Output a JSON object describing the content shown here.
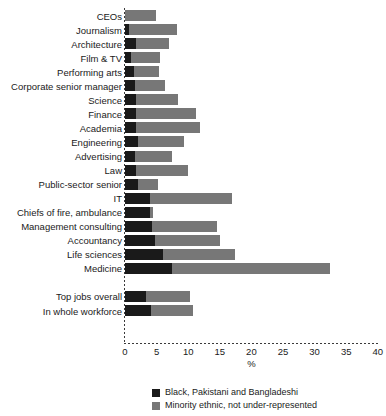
{
  "chart_data": {
    "type": "bar",
    "orientation": "horizontal",
    "stacked": true,
    "title": "",
    "xlabel": "%",
    "ylabel": "",
    "xlim": [
      0,
      40
    ],
    "xticks": [
      0,
      5,
      10,
      15,
      20,
      25,
      30,
      35,
      40
    ],
    "grid": false,
    "legend_position": "bottom",
    "colors": {
      "black_pakistani_bangladeshi": "#1a1a1a",
      "minority_ethnic_not_under_represented": "#777777",
      "background": "#ffffff",
      "text": "#1a1a1a"
    },
    "series": [
      {
        "name": "Black, Pakistani and Bangladeshi",
        "color": "#1a1a1a"
      },
      {
        "name": "Minority ethnic, not under-represented",
        "color": "#777777"
      }
    ],
    "categories": [
      "CEOs",
      "Journalism",
      "Architecture",
      "Film & TV",
      "Performing arts",
      "Corporate senior manager",
      "Science",
      "Finance",
      "Academia",
      "Engineering",
      "Advertising",
      "Law",
      "Public-sector senior",
      "IT",
      "Chiefs of fire, ambulance",
      "Management consulting",
      "Accountancy",
      "Life sciences",
      "Medicine",
      "Top jobs overall",
      "In whole workforce"
    ],
    "rows": [
      {
        "label": "CEOs",
        "black": 0.0,
        "minority": 4.9,
        "group": "occupations"
      },
      {
        "label": "Journalism",
        "black": 0.6,
        "minority": 7.7,
        "group": "occupations"
      },
      {
        "label": "Architecture",
        "black": 1.7,
        "minority": 5.3,
        "group": "occupations"
      },
      {
        "label": "Film & TV",
        "black": 1.0,
        "minority": 4.5,
        "group": "occupations"
      },
      {
        "label": "Performing arts",
        "black": 1.4,
        "minority": 4.0,
        "group": "occupations"
      },
      {
        "label": "Corporate senior manager",
        "black": 1.6,
        "minority": 4.7,
        "group": "occupations"
      },
      {
        "label": "Science",
        "black": 1.7,
        "minority": 6.7,
        "group": "occupations"
      },
      {
        "label": "Finance",
        "black": 1.7,
        "minority": 9.5,
        "group": "occupations"
      },
      {
        "label": "Academia",
        "black": 1.7,
        "minority": 10.2,
        "group": "occupations"
      },
      {
        "label": "Engineering",
        "black": 2.0,
        "minority": 7.4,
        "group": "occupations"
      },
      {
        "label": "Advertising",
        "black": 1.6,
        "minority": 5.9,
        "group": "occupations"
      },
      {
        "label": "Law",
        "black": 1.7,
        "minority": 8.2,
        "group": "occupations"
      },
      {
        "label": "Public-sector senior",
        "black": 2.1,
        "minority": 3.1,
        "group": "occupations"
      },
      {
        "label": "IT",
        "black": 4.0,
        "minority": 13.0,
        "group": "occupations"
      },
      {
        "label": "Chiefs of fire, ambulance",
        "black": 4.0,
        "minority": 0.4,
        "group": "occupations"
      },
      {
        "label": "Management consulting",
        "black": 4.3,
        "minority": 10.3,
        "group": "occupations"
      },
      {
        "label": "Accountancy",
        "black": 4.7,
        "minority": 10.3,
        "group": "occupations"
      },
      {
        "label": "Life sciences",
        "black": 6.0,
        "minority": 11.4,
        "group": "occupations"
      },
      {
        "label": "Medicine",
        "black": 7.4,
        "minority": 25.1,
        "group": "occupations"
      },
      {
        "label": "Top jobs overall",
        "black": 3.3,
        "minority": 7.0,
        "group": "summary"
      },
      {
        "label": "In whole workforce",
        "black": 4.1,
        "minority": 6.6,
        "group": "summary"
      }
    ]
  },
  "axis": {
    "x_title": "%",
    "tick_labels": [
      "0",
      "5",
      "10",
      "15",
      "20",
      "25",
      "30",
      "35",
      "40"
    ]
  },
  "legend": {
    "items": [
      {
        "label": "Black, Pakistani and Bangladeshi",
        "swatch": "black"
      },
      {
        "label": "Minority ethnic, not under-represented",
        "swatch": "grey"
      }
    ]
  }
}
